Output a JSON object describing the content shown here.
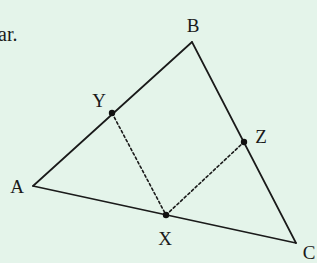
{
  "background": "#e4f4ea",
  "text_fragment": {
    "text": "ar.",
    "x": -2,
    "y": 24
  },
  "colors": {
    "line": "#1a1a1a",
    "dashed": "#1a1a1a",
    "point": "#111111"
  },
  "vertices": {
    "A": {
      "label": "A",
      "x": 33,
      "y": 186,
      "lx": 17,
      "ly": 186
    },
    "B": {
      "label": "B",
      "x": 192,
      "y": 42,
      "lx": 193,
      "ly": 25
    },
    "C": {
      "label": "C",
      "x": 296,
      "y": 243,
      "lx": 309,
      "ly": 252
    }
  },
  "points": {
    "X": {
      "label": "X",
      "x": 166,
      "y": 215,
      "lx": 165,
      "ly": 238
    },
    "Y": {
      "label": "Y",
      "x": 112,
      "y": 113,
      "lx": 99,
      "ly": 100
    },
    "Z": {
      "label": "Z",
      "x": 244,
      "y": 142,
      "lx": 261,
      "ly": 136
    }
  },
  "segments_solid": [
    [
      "A",
      "B"
    ],
    [
      "B",
      "C"
    ],
    [
      "C",
      "A"
    ]
  ],
  "segments_dashed": [
    [
      "Y",
      "X"
    ],
    [
      "X",
      "Z"
    ]
  ]
}
